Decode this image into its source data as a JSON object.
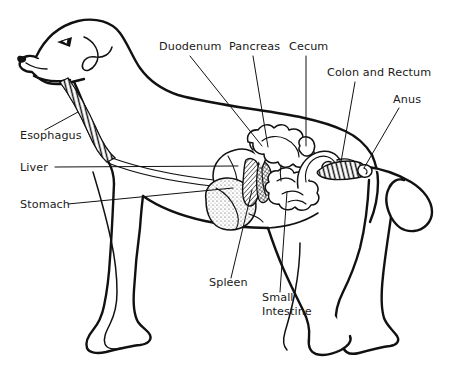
{
  "figure": {
    "style": "black-and-white line drawing",
    "background_color": "#ffffff",
    "line_color": "#111111"
  },
  "labels": [
    {
      "id": "duodenum",
      "text": "Duodenum",
      "x": 159,
      "y": 50,
      "anchor": "start",
      "lines": [
        "Duodenum"
      ]
    },
    {
      "id": "pancreas",
      "text": "Pancreas",
      "x": 229,
      "y": 50,
      "anchor": "start",
      "lines": [
        "Pancreas"
      ]
    },
    {
      "id": "cecum",
      "text": "Cecum",
      "x": 289,
      "y": 50,
      "anchor": "start",
      "lines": [
        "Cecum"
      ]
    },
    {
      "id": "colon-and-rectum",
      "text": "Colon and Rectum",
      "x": 327,
      "y": 76,
      "anchor": "start",
      "lines": [
        "Colon and Rectum"
      ]
    },
    {
      "id": "anus",
      "text": "Anus",
      "x": 393,
      "y": 103,
      "anchor": "start",
      "lines": [
        "Anus"
      ]
    },
    {
      "id": "esophagus",
      "text": "Esophagus",
      "x": 20,
      "y": 139,
      "anchor": "start",
      "lines": [
        "Esophagus"
      ]
    },
    {
      "id": "liver",
      "text": "Liver",
      "x": 20,
      "y": 171,
      "anchor": "start",
      "lines": [
        "Liver"
      ]
    },
    {
      "id": "stomach",
      "text": "Stomach",
      "x": 20,
      "y": 208,
      "anchor": "start",
      "lines": [
        "Stomach"
      ]
    },
    {
      "id": "spleen",
      "text": "Spleen",
      "x": 209,
      "y": 286,
      "anchor": "start",
      "lines": [
        "Spleen"
      ]
    },
    {
      "id": "small-intestine",
      "text": "Small Intestine",
      "x": 262,
      "y": 301,
      "anchor": "start",
      "lines": [
        "Small",
        "Intestine"
      ]
    }
  ],
  "leader_lines": [
    {
      "id": "duodenum-leader",
      "from_label": "Duodenum",
      "path": "M 190 56 L 262 146"
    },
    {
      "id": "pancreas-leader",
      "from_label": "Pancreas",
      "path": "M 253 56 L 268 147"
    },
    {
      "id": "cecum-leader",
      "from_label": "Cecum",
      "path": "M 306 56 L 306 146"
    },
    {
      "id": "colon-and-rectum-leader",
      "from_label": "Colon and Rectum",
      "path": "M 355 82 L 341 162"
    },
    {
      "id": "anus-leader",
      "from_label": "Anus",
      "path": "M 399 108 L 363 168"
    },
    {
      "id": "esophagus-leader",
      "from_label": "Esophagus",
      "path": "M 45 130 L 78 112"
    },
    {
      "id": "liver-leader",
      "from_label": "Liver",
      "path": "M 55 167 L 238 166"
    },
    {
      "id": "stomach-leader",
      "from_label": "Stomach",
      "path": "M 68 204 L 233 188"
    },
    {
      "id": "spleen-leader",
      "from_label": "Spleen",
      "path": "M 231 278 L 252 190"
    },
    {
      "id": "small-intestine-leader",
      "from_label": "Small Intestine",
      "path": "M 280 292 L 287 192"
    }
  ],
  "organs": [
    {
      "id": "esophagus-organ",
      "name": "Esophagus",
      "description": "ringed tube running down the neck from the throat to the stomach"
    },
    {
      "id": "stomach-organ",
      "name": "Stomach",
      "description": "stippled sac-like organ behind the ribcage"
    },
    {
      "id": "liver-organ",
      "name": "Liver",
      "description": "large lobed organ above and in front of the stomach"
    },
    {
      "id": "spleen-organ",
      "name": "Spleen",
      "description": "elongated hatched organ beside the stomach"
    },
    {
      "id": "pancreas-organ",
      "name": "Pancreas",
      "description": "cross-hatched organ near the duodenum"
    },
    {
      "id": "duodenum-organ",
      "name": "Duodenum",
      "description": "first loop of small intestine leaving the stomach"
    },
    {
      "id": "small-intestine-organ",
      "name": "Small Intestine",
      "description": "coiled mass of intestinal loops in mid-abdomen"
    },
    {
      "id": "cecum-organ",
      "name": "Cecum",
      "description": "pouch at the junction of small and large intestine"
    },
    {
      "id": "colon-organ",
      "name": "Colon and Rectum",
      "description": "large curved bowel leading to the hatched rectum"
    },
    {
      "id": "anus-organ",
      "name": "Anus",
      "description": "terminal opening at the end of the rectum"
    }
  ]
}
